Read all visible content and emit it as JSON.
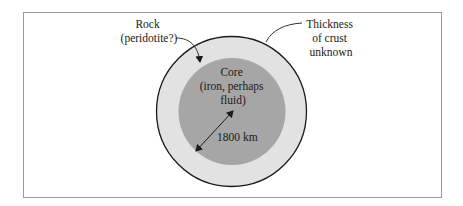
{
  "figure": {
    "frame": {
      "x": 23,
      "y": 12,
      "width": 418,
      "height": 185,
      "stroke": "#9a9a9a"
    },
    "planet": {
      "center_x": 231.5,
      "center_y": 111.5,
      "outer_radius": 75,
      "core_radius": 53.5,
      "mantle_color": "#e2e2e2",
      "core_color": "#a6a6a6",
      "outline_color": "#1a1a1a"
    },
    "labels": {
      "mantle": {
        "line1": "Rock",
        "line2": "(peridotite?)"
      },
      "crust": {
        "line1": "Thickness",
        "line2": "of crust",
        "line3": "unknown"
      },
      "core": {
        "line1": "Core",
        "line2": "(iron, perhaps",
        "line3": "fluid)"
      },
      "radius": {
        "text": "1800 km"
      }
    }
  }
}
